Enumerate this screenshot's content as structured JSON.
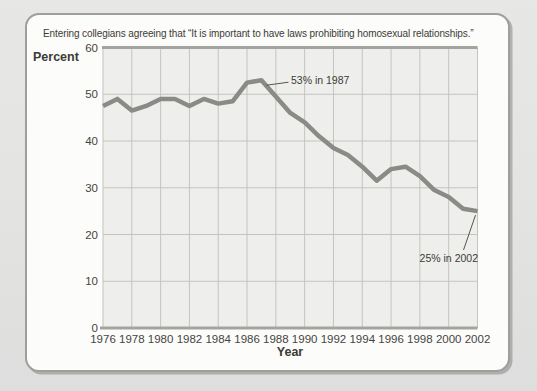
{
  "chart": {
    "title": "Entering collegians agreeing that “It is important to have laws prohibiting homosexual relationships.”"
  },
  "chart_data": {
    "type": "line",
    "title": "Entering collegians agreeing that “It is important to have laws prohibiting homosexual relationships.”",
    "xlabel": "Year",
    "ylabel": "Percent",
    "xlim": [
      1976,
      2002
    ],
    "ylim": [
      0,
      60
    ],
    "grid": true,
    "x_ticks": [
      "1976",
      "1978",
      "1980",
      "1982",
      "1984",
      "1986",
      "1988",
      "1990",
      "1992",
      "1994",
      "1996",
      "1998",
      "2000",
      "2002"
    ],
    "y_ticks": [
      "0",
      "10",
      "20",
      "30",
      "40",
      "50",
      "60"
    ],
    "x": [
      1976,
      1977,
      1978,
      1979,
      1980,
      1981,
      1982,
      1983,
      1984,
      1985,
      1986,
      1987,
      1988,
      1989,
      1990,
      1991,
      1992,
      1993,
      1994,
      1995,
      1996,
      1997,
      1998,
      1999,
      2000,
      2001,
      2002
    ],
    "values": [
      47.5,
      49,
      46.5,
      47.5,
      49,
      49,
      47.5,
      49,
      48,
      48.5,
      52.5,
      53,
      49.5,
      46,
      44,
      41,
      38.5,
      37,
      34.5,
      31.5,
      34,
      34.5,
      32.5,
      29.5,
      28,
      25.5,
      25
    ],
    "annotations": [
      {
        "text": "53% in 1987",
        "year": 1987,
        "value": 53
      },
      {
        "text": "25% in 2002",
        "year": 2002,
        "value": 25
      }
    ],
    "colors": {
      "line": "#8a8b87",
      "plot_background": "#eeefec",
      "gridline": "#c3c4c0",
      "axis": "#a3a4a0",
      "callout": "#55554f",
      "text": "#45453f"
    }
  }
}
